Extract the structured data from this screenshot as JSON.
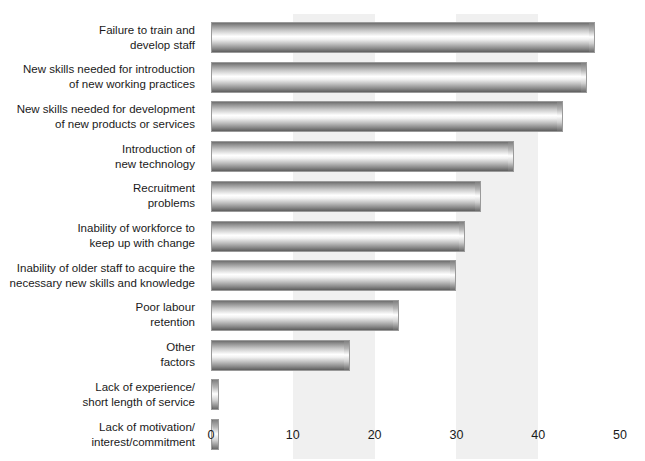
{
  "chart_data": {
    "type": "bar",
    "orientation": "horizontal",
    "title": "",
    "xlabel": "",
    "ylabel": "",
    "xlim": [
      0,
      50
    ],
    "xticks": [
      0,
      10,
      20,
      30,
      40,
      50
    ],
    "grid": false,
    "shaded_bands": [
      [
        10,
        20
      ],
      [
        30,
        40
      ]
    ],
    "legend": null,
    "categories": [
      "Failure to train and develop staff",
      "New skills needed for introduction of new working practices",
      "New skills needed for development of new products or services",
      "Introduction of new technology",
      "Recruitment problems",
      "Inability of workforce to keep up with change",
      "Inability of older staff to acquire the necessary new skills and knowledge",
      "Poor labour retention",
      "Other factors",
      "Lack of experience/ short length of service",
      "Lack of motivation/ interest/commitment"
    ],
    "values": [
      47,
      46,
      43,
      37,
      33,
      31,
      30,
      23,
      17,
      1,
      1
    ],
    "bars": [
      {
        "line1": "Failure to train and",
        "line2": "develop staff",
        "value": 47
      },
      {
        "line1": "New skills needed for introduction",
        "line2": "of new working practices",
        "value": 46
      },
      {
        "line1": "New skills needed for development",
        "line2": "of new products or services",
        "value": 43
      },
      {
        "line1": "Introduction of",
        "line2": "new technology",
        "value": 37
      },
      {
        "line1": "Recruitment",
        "line2": "problems",
        "value": 33
      },
      {
        "line1": "Inability of workforce to",
        "line2": "keep up with change",
        "value": 31
      },
      {
        "line1": "Inability of older staff to acquire the",
        "line2": "necessary new skills and knowledge",
        "value": 30
      },
      {
        "line1": "Poor labour",
        "line2": "retention",
        "value": 23
      },
      {
        "line1": "Other",
        "line2": "factors",
        "value": 17
      },
      {
        "line1": "Lack of experience/",
        "line2": "short length of service",
        "value": 1
      },
      {
        "line1": "Lack of motivation/",
        "line2": "interest/commitment",
        "value": 1
      }
    ],
    "tick_labels": [
      "0",
      "10",
      "20",
      "30",
      "40",
      "50"
    ],
    "colors": {
      "bar_fill_dark": "#6f6f6f",
      "bar_fill_light": "#ffffff",
      "bar_border": "#9a9a9a",
      "band": "#f0f0f0",
      "text": "#1a1a1a",
      "background": "#ffffff"
    }
  }
}
